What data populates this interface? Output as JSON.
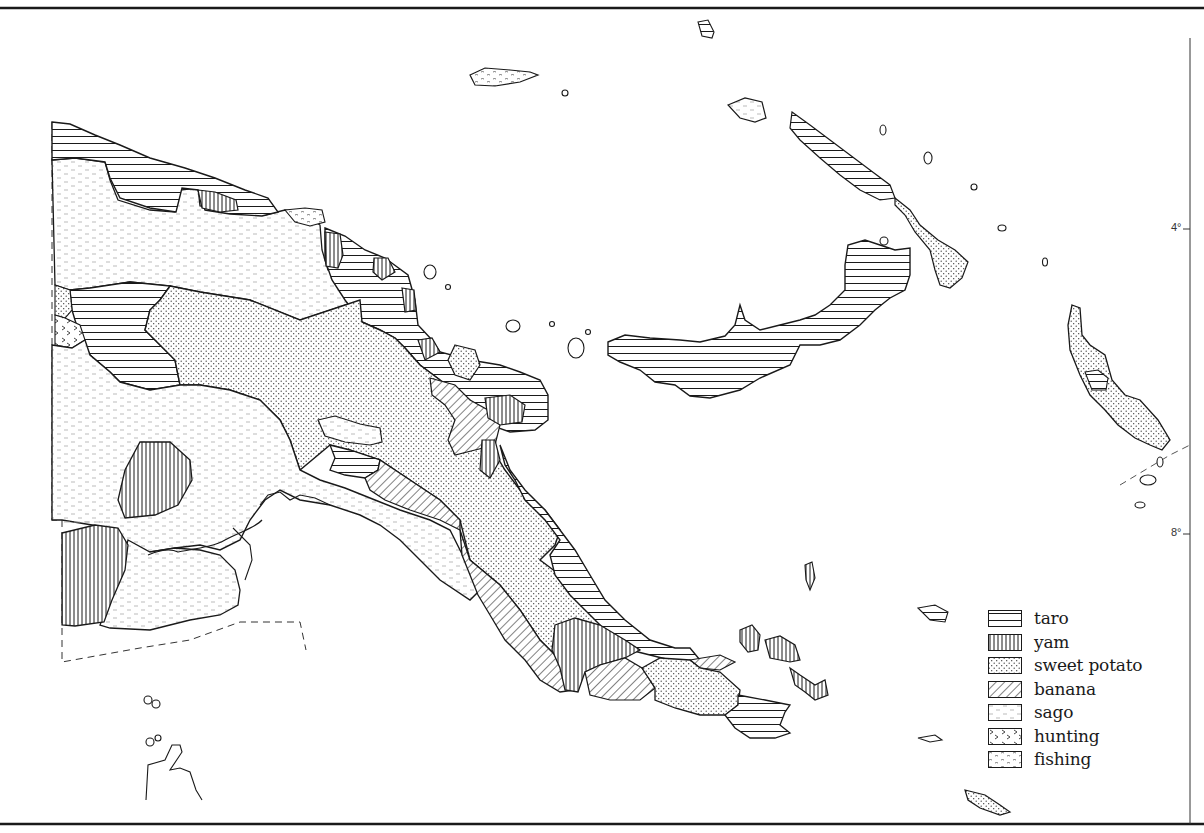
{
  "map": {
    "subject": "Papua New Guinea staple food zones",
    "colors": {
      "ink": "#1a1a1a",
      "paper": "#ffffff"
    },
    "latitude_ticks": [
      {
        "label": "4°",
        "y": 229
      },
      {
        "label": "8°",
        "y": 534
      }
    ]
  },
  "legend": {
    "items": [
      {
        "key": "taro",
        "label": "taro",
        "pattern": "horizontal-lines"
      },
      {
        "key": "yam",
        "label": "yam",
        "pattern": "vertical-lines"
      },
      {
        "key": "sweet_potato",
        "label": "sweet potato",
        "pattern": "dots"
      },
      {
        "key": "banana",
        "label": "banana",
        "pattern": "diagonal-lines"
      },
      {
        "key": "sago",
        "label": "sago",
        "pattern": "light-dashes"
      },
      {
        "key": "hunting",
        "label": "hunting",
        "pattern": "chevrons"
      },
      {
        "key": "fishing",
        "label": "fishing",
        "pattern": "wavy-dashes"
      }
    ]
  }
}
